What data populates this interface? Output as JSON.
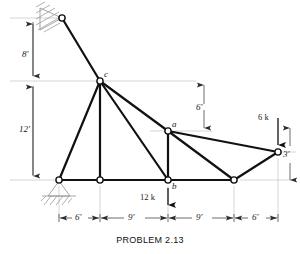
{
  "figure": {
    "caption": "PROBLEM 2.13",
    "type": "structural-truss-diagram",
    "colors": {
      "member": "#111111",
      "dimension": "#4a4a4a",
      "hatch": "#9a9a9a",
      "node_fill": "#ffffff"
    }
  },
  "nodes": [
    {
      "id": "top_support",
      "label": "",
      "x": 62,
      "y": 18
    },
    {
      "id": "c",
      "label": "c",
      "x": 100,
      "y": 81
    },
    {
      "id": "left_support",
      "label": "",
      "x": 59,
      "y": 180
    },
    {
      "id": "bottom_mid",
      "label": "",
      "x": 100,
      "y": 180
    },
    {
      "id": "b",
      "label": "b",
      "x": 168,
      "y": 180
    },
    {
      "id": "a",
      "label": "a",
      "x": 168,
      "y": 131
    },
    {
      "id": "bottom_right",
      "label": "",
      "x": 234,
      "y": 180
    },
    {
      "id": "right",
      "label": "",
      "x": 278,
      "y": 152
    }
  ],
  "members": [
    {
      "from": "top_support",
      "to": "c"
    },
    {
      "from": "c",
      "to": "left_support"
    },
    {
      "from": "c",
      "to": "bottom_mid"
    },
    {
      "from": "c",
      "to": "b"
    },
    {
      "from": "c",
      "to": "a"
    },
    {
      "from": "a",
      "to": "b"
    },
    {
      "from": "a",
      "to": "right"
    },
    {
      "from": "a",
      "to": "bottom_right"
    },
    {
      "from": "left_support",
      "to": "bottom_mid"
    },
    {
      "from": "bottom_mid",
      "to": "b"
    },
    {
      "from": "b",
      "to": "bottom_right"
    },
    {
      "from": "bottom_right",
      "to": "right"
    }
  ],
  "loads": [
    {
      "id": "load-12k",
      "label": "12 k",
      "at": "b",
      "direction": "down"
    },
    {
      "id": "load-6k",
      "label": "6 k",
      "at": "right",
      "direction": "down"
    }
  ],
  "dimensions": {
    "vertical_left": [
      {
        "id": "dim-8ft",
        "label": "8'"
      },
      {
        "id": "dim-12ft",
        "label": "12'"
      }
    ],
    "vertical_right": [
      {
        "id": "dim-6ft-a",
        "label": "6'"
      },
      {
        "id": "dim-3ft",
        "label": "3'"
      }
    ],
    "horizontal_bottom": [
      {
        "id": "dim-6ft-1",
        "label": "6'"
      },
      {
        "id": "dim-9ft-1",
        "label": "9'"
      },
      {
        "id": "dim-9ft-2",
        "label": "9'"
      },
      {
        "id": "dim-6ft-2",
        "label": "6'"
      }
    ]
  },
  "supports": [
    {
      "id": "top-pin-support",
      "kind": "pin-hatched",
      "at": "top_support"
    },
    {
      "id": "left-pin-support",
      "kind": "pin-triangle",
      "at": "left_support"
    }
  ]
}
